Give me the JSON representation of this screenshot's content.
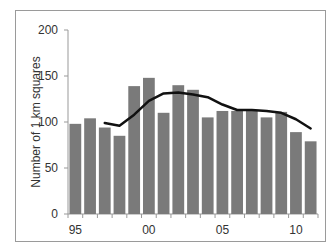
{
  "chart_data": {
    "type": "bar",
    "title": "",
    "xlabel": "",
    "ylabel": "Number of 1 km squares",
    "ylim": [
      0,
      200
    ],
    "yticks": [
      0,
      50,
      100,
      150,
      200
    ],
    "xtick_labels": [
      "95",
      "00",
      "05",
      "10"
    ],
    "categories": [
      "1995",
      "1996",
      "1997",
      "1998",
      "1999",
      "2000",
      "2001",
      "2002",
      "2003",
      "2004",
      "2005",
      "2006",
      "2007",
      "2008",
      "2009",
      "2010",
      "2011"
    ],
    "series": [
      {
        "name": "Annual count",
        "type": "bar",
        "color": "#7a7a7a",
        "values": [
          98,
          104,
          94,
          85,
          139,
          148,
          110,
          140,
          135,
          105,
          112,
          112,
          112,
          105,
          111,
          89,
          79
        ]
      },
      {
        "name": "Moving average",
        "type": "line",
        "color": "#111111",
        "values": [
          null,
          null,
          99,
          96,
          108,
          123,
          131,
          132,
          130,
          127,
          119,
          113,
          113,
          112,
          110,
          103,
          93
        ]
      }
    ],
    "grid": false,
    "legend": null
  },
  "axis": {
    "ylabel": "Number of 1 km squares",
    "y_tick_labels": [
      "0",
      "50",
      "100",
      "150",
      "200"
    ],
    "x_tick_labels": [
      "95",
      "00",
      "05",
      "10"
    ]
  }
}
